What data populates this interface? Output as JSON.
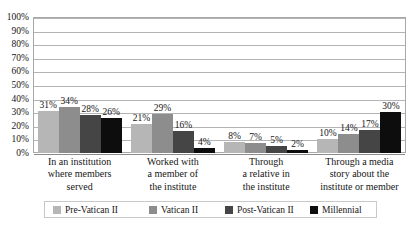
{
  "chart_data": {
    "type": "bar",
    "title": "",
    "subtitle": "",
    "xlabel": "",
    "ylabel": "",
    "ylim": [
      0,
      100
    ],
    "grid": true,
    "legend_position": "bottom",
    "value_suffix": "%",
    "categories": [
      "In an institution where members served",
      "Worked with a member of the institute",
      "Through a relative in the institute",
      "Through a media story about the institute or member"
    ],
    "category_lines": [
      [
        "In an institution",
        "where members",
        "served"
      ],
      [
        "Worked with",
        "a member of",
        "the institute"
      ],
      [
        "Through",
        "a relative in",
        "the institute"
      ],
      [
        "Through a media",
        "story about the",
        "institute or member"
      ]
    ],
    "yticks": [
      "0%",
      "10%",
      "20%",
      "30%",
      "40%",
      "50%",
      "60%",
      "70%",
      "80%",
      "90%",
      "100%"
    ],
    "ytick_values": [
      0,
      10,
      20,
      30,
      40,
      50,
      60,
      70,
      80,
      90,
      100
    ],
    "series": [
      {
        "name": "Pre-Vatican II",
        "color": "#b6b6b6",
        "values": [
          31,
          21,
          8,
          10
        ],
        "labels": [
          "31%",
          "21%",
          "8%",
          "10%"
        ]
      },
      {
        "name": "Vatican II",
        "color": "#8d8d8d",
        "values": [
          34,
          29,
          7,
          14
        ],
        "labels": [
          "34%",
          "29%",
          "7%",
          "14%"
        ]
      },
      {
        "name": "Post-Vatican II",
        "color": "#454545",
        "values": [
          28,
          16,
          5,
          17
        ],
        "labels": [
          "28%",
          "16%",
          "5%",
          "17%"
        ]
      },
      {
        "name": "Millennial",
        "color": "#0d0d0d",
        "values": [
          26,
          4,
          2,
          30
        ],
        "labels": [
          "26%",
          "4%",
          "2%",
          "30%"
        ]
      }
    ]
  }
}
